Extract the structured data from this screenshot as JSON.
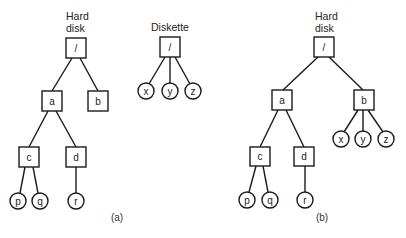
{
  "diagram": {
    "panel_a": {
      "caption": "(a)",
      "hard_disk": {
        "label_line1": "Hard",
        "label_line2": "disk",
        "root": "/",
        "nodes": {
          "a": "a",
          "b": "b",
          "c": "c",
          "d": "d",
          "p": "p",
          "q": "q",
          "r": "r"
        }
      },
      "diskette": {
        "label": "Diskette",
        "root": "/",
        "nodes": {
          "x": "x",
          "y": "y",
          "z": "z"
        }
      }
    },
    "panel_b": {
      "caption": "(b)",
      "hard_disk": {
        "label_line1": "Hard",
        "label_line2": "disk",
        "root": "/",
        "nodes": {
          "a": "a",
          "b": "b",
          "c": "c",
          "d": "d",
          "p": "p",
          "q": "q",
          "r": "r",
          "x": "x",
          "y": "y",
          "z": "z"
        }
      }
    },
    "legend": {
      "square": "directory",
      "circle": "file"
    }
  }
}
